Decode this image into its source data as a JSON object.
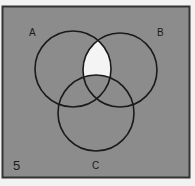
{
  "diagram": {
    "type": "venn",
    "figure_number": "5",
    "background_color": "#8c8c8c",
    "highlight_color": "#f4f4f4",
    "stroke_color": "#1a1a1a",
    "sets": [
      {
        "label": "A",
        "cx": 73,
        "cy": 69,
        "r": 38
      },
      {
        "label": "B",
        "cx": 120,
        "cy": 70,
        "r": 37
      },
      {
        "label": "C",
        "cx": 96,
        "cy": 113,
        "r": 38
      }
    ],
    "unshaded_region": "A ∩ B − C",
    "shaded_region": "everything else"
  }
}
